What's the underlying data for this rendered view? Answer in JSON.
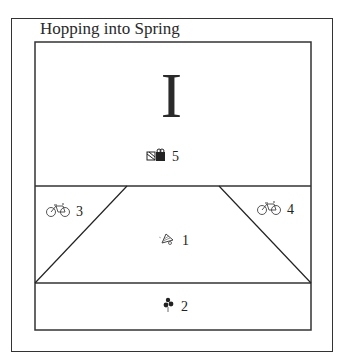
{
  "title": "Hopping into Spring",
  "header_glyph": "I",
  "pieces": [
    {
      "number": "5",
      "icon": "gift-icon"
    },
    {
      "number": "3",
      "icon": "bicycle-icon"
    },
    {
      "number": "4",
      "icon": "bicycle-icon"
    },
    {
      "number": "1",
      "icon": "bell-icon"
    },
    {
      "number": "2",
      "icon": "balloons-icon"
    }
  ],
  "colors": {
    "line": "#333333",
    "background": "#ffffff"
  }
}
